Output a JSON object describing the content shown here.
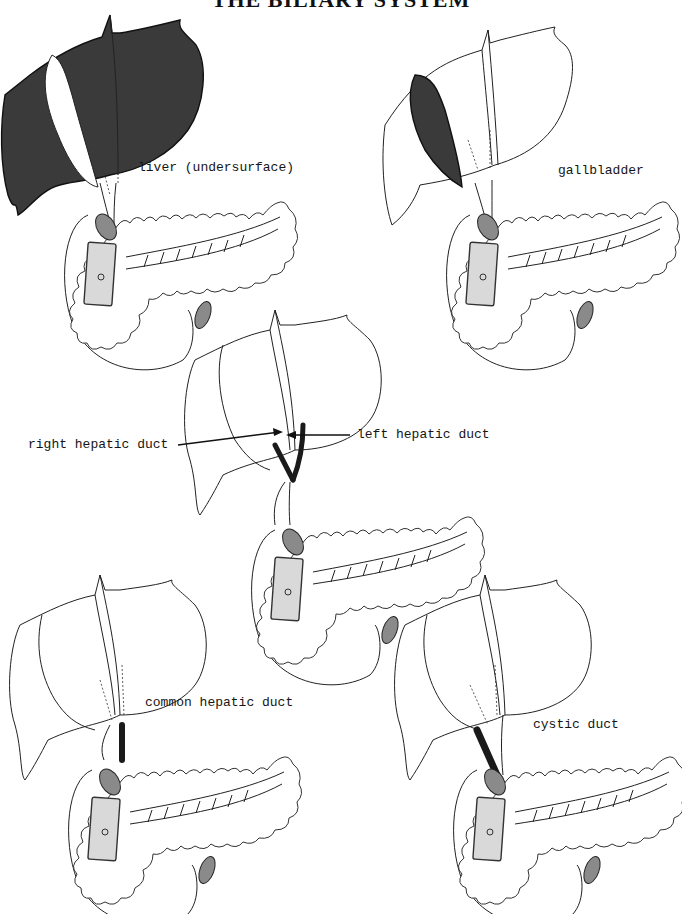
{
  "page": {
    "title": "THE BILIARY SYSTEM"
  },
  "panels": [
    {
      "id": "liver",
      "label": "liver (undersurface)",
      "highlighted_structure": "liver",
      "highlight_color": "#3a3a3a"
    },
    {
      "id": "gallbladder",
      "label": "gallbladder",
      "highlighted_structure": "gallbladder",
      "highlight_color": "#3a3a3a"
    },
    {
      "id": "hepatic-ducts",
      "labels": {
        "right": "right hepatic duct",
        "left": "left hepatic duct"
      },
      "highlighted_structure": "right and left hepatic ducts",
      "highlight_color": "#1a1a1a"
    },
    {
      "id": "common-hepatic-duct",
      "label": "common hepatic duct",
      "highlighted_structure": "common hepatic duct",
      "highlight_color": "#1a1a1a"
    },
    {
      "id": "cystic-duct",
      "label": "cystic duct",
      "highlighted_structure": "cystic duct",
      "highlight_color": "#1a1a1a"
    }
  ],
  "common_structures": [
    "liver",
    "gallbladder",
    "duodenum",
    "pancreas",
    "pancreatic duct",
    "stomach cut end",
    "vessels"
  ]
}
